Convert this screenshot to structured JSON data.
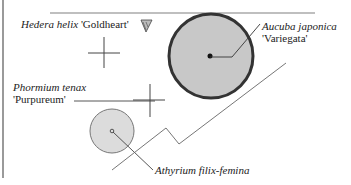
{
  "plants": [
    {
      "id": "hedera",
      "genus_species": "Hedera helix",
      "cultivar": "'Goldheart'"
    },
    {
      "id": "aucuba",
      "genus_species": "Aucuba japonica",
      "cultivar": "'Variegata'"
    },
    {
      "id": "phormium",
      "genus_species": "Phormium tenax",
      "cultivar": "'Purpureum'"
    },
    {
      "id": "athyrium",
      "genus_species": "Athyrium filix-femina",
      "cultivar": ""
    }
  ],
  "colors": {
    "circle_fill": "#c8c8c8",
    "circle_stroke": "#333333",
    "small_circle_fill": "#dcdcdc",
    "small_circle_stroke": "#777777",
    "line": "#555555",
    "border": "#9a9a9a"
  },
  "icons": {
    "hedera_marker": "triangle-marker-icon"
  }
}
